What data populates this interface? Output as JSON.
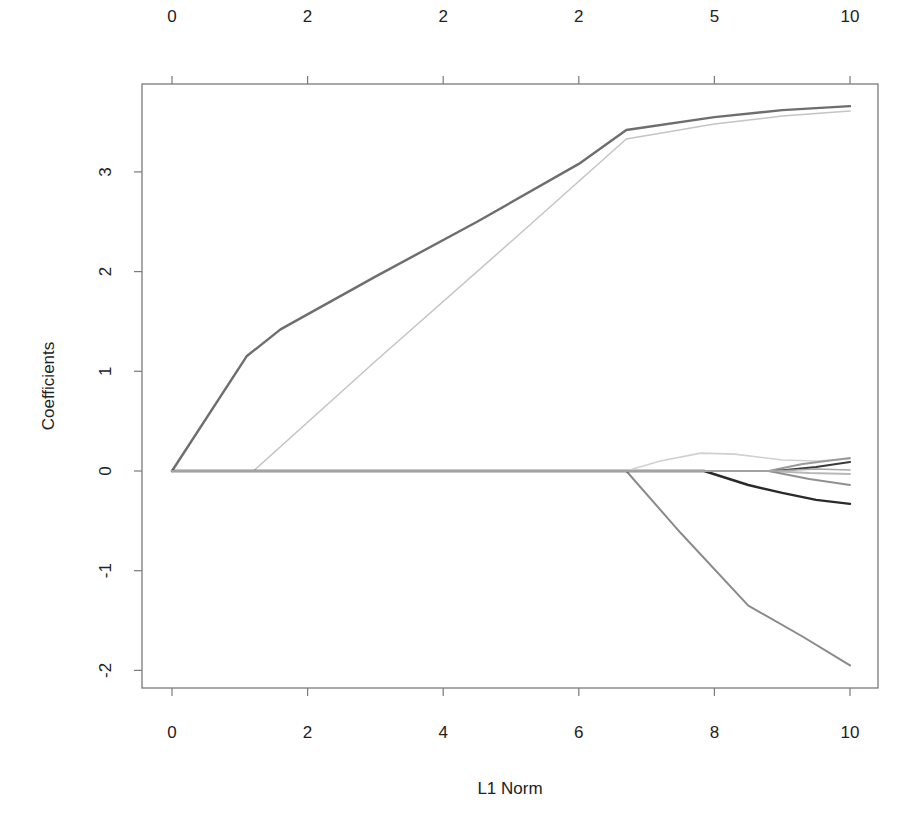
{
  "chart_data": {
    "type": "line",
    "title": "",
    "xlabel": "L1 Norm",
    "ylabel": "Coefficients",
    "xlim": [
      -0.45,
      10.45
    ],
    "ylim": [
      -2.17,
      3.88
    ],
    "grid": false,
    "legend": null,
    "x_ticks": [
      0,
      2,
      4,
      6,
      8,
      10
    ],
    "x_tick_labels": [
      "0",
      "2",
      "4",
      "6",
      "8",
      "10"
    ],
    "y_ticks": [
      -2,
      -1,
      0,
      1,
      2,
      3
    ],
    "y_tick_labels": [
      "-2",
      "-1",
      "0",
      "1",
      "2",
      "3"
    ],
    "top_axis": {
      "description": "Number of nonzero coefficients",
      "tick_positions": [
        0,
        2,
        4,
        6,
        8,
        10
      ],
      "tick_labels": [
        "0",
        "2",
        "2",
        "2",
        "5",
        "10"
      ]
    },
    "series": [
      {
        "name": "coef-1",
        "color": "#6e6e6e",
        "width": 2.4,
        "x": [
          0,
          1.1,
          1.6,
          3.0,
          4.5,
          6.0,
          6.7,
          8.0,
          9.0,
          10.0
        ],
        "y": [
          0,
          1.15,
          1.42,
          1.95,
          2.5,
          3.08,
          3.42,
          3.55,
          3.62,
          3.66
        ]
      },
      {
        "name": "coef-2",
        "color": "#c4c4c4",
        "width": 1.5,
        "x": [
          0,
          1.2,
          3.0,
          5.0,
          6.7,
          8.0,
          9.0,
          10.0
        ],
        "y": [
          0,
          0,
          1.1,
          2.3,
          3.33,
          3.48,
          3.56,
          3.61
        ]
      },
      {
        "name": "coef-3",
        "color": "#8a8a8a",
        "width": 2.0,
        "x": [
          0,
          6.7,
          7.5,
          8.5,
          9.3,
          10.0
        ],
        "y": [
          0,
          0,
          -0.62,
          -1.35,
          -1.66,
          -1.95
        ]
      },
      {
        "name": "coef-4",
        "color": "#2a2a2a",
        "width": 2.4,
        "x": [
          0,
          7.85,
          8.5,
          9.0,
          9.5,
          10.0
        ],
        "y": [
          0,
          0,
          -0.14,
          -0.22,
          -0.29,
          -0.33
        ]
      },
      {
        "name": "coef-5",
        "color": "#d0d0d0",
        "width": 1.6,
        "x": [
          0,
          6.7,
          7.2,
          7.8,
          8.3,
          9.0,
          9.5,
          10.0
        ],
        "y": [
          0,
          0,
          0.1,
          0.18,
          0.17,
          0.11,
          0.1,
          0.12
        ]
      },
      {
        "name": "coef-6",
        "color": "#9a9a9a",
        "width": 1.8,
        "x": [
          0,
          8.8,
          9.3,
          10.0
        ],
        "y": [
          0,
          0,
          0.07,
          0.13
        ]
      },
      {
        "name": "coef-7",
        "color": "#3a3a3a",
        "width": 2.2,
        "x": [
          0,
          8.9,
          9.5,
          10.0
        ],
        "y": [
          0,
          0,
          0.04,
          0.09
        ]
      },
      {
        "name": "coef-8",
        "color": "#b8b8b8",
        "width": 1.8,
        "x": [
          0,
          8.8,
          9.4,
          10.0
        ],
        "y": [
          0,
          0,
          -0.02,
          -0.03
        ]
      },
      {
        "name": "coef-9",
        "color": "#909090",
        "width": 1.8,
        "x": [
          0,
          8.8,
          9.4,
          10.0
        ],
        "y": [
          0,
          0,
          -0.08,
          -0.14
        ]
      },
      {
        "name": "coef-10",
        "color": "#a8a8a8",
        "width": 1.6,
        "x": [
          0,
          8.9,
          9.5,
          10.0
        ],
        "y": [
          0,
          0,
          0.02,
          0.01
        ]
      }
    ]
  },
  "plot": {
    "frame_color": "#7a7a7a",
    "text_color": "#222222"
  }
}
